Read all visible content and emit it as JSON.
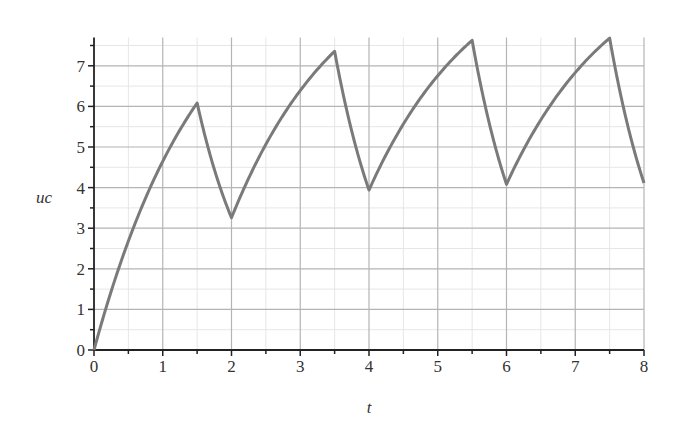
{
  "chart_data": {
    "type": "line",
    "title": "",
    "xlabel": "t",
    "ylabel": "uc",
    "xlim": [
      0,
      8
    ],
    "ylim": [
      0,
      7.7
    ],
    "x_ticks": [
      "0",
      "1",
      "2",
      "3",
      "4",
      "5",
      "6",
      "7",
      "8"
    ],
    "y_ticks": [
      "0",
      "1",
      "2",
      "3",
      "4",
      "5",
      "6",
      "7"
    ],
    "grid": true,
    "legend": null,
    "colors": {
      "curve": "#7a7a7a",
      "grid_major": "#b4b4b4",
      "grid_minor": "#e6e6e6",
      "axis": "#222222"
    },
    "model": {
      "description": "Capacitor voltage: charging for 1.5 units, discharging for 0.5 units, period 2",
      "source_voltage": 10,
      "tau_charge": 1.6,
      "tau_discharge": 0.8,
      "charge_duration": 1.5,
      "period": 2
    },
    "series": [
      {
        "name": "uc",
        "key_points": [
          {
            "t": 0,
            "uc": 0
          },
          {
            "t": 0.5,
            "uc": 2.7
          },
          {
            "t": 1,
            "uc": 4.7
          },
          {
            "t": 1.5,
            "uc": 6.1
          },
          {
            "t": 2,
            "uc": 3.25
          },
          {
            "t": 3.5,
            "uc": 7.35
          },
          {
            "t": 4,
            "uc": 3.95
          },
          {
            "t": 5.5,
            "uc": 7.6
          },
          {
            "t": 6,
            "uc": 4.1
          },
          {
            "t": 7.5,
            "uc": 7.67
          },
          {
            "t": 8,
            "uc": 4.12
          }
        ]
      }
    ]
  }
}
